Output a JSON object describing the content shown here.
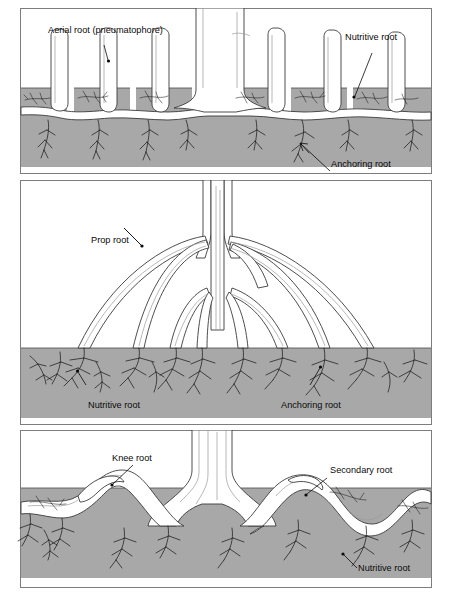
{
  "figure": {
    "background_color": "#ffffff",
    "soil_color": "#a8a8a8",
    "outline_color": "#3a3a3a",
    "label_color": "#0a0a0a"
  },
  "panels": [
    {
      "id": "aerial",
      "name": "Aerial root panel",
      "labels": [
        {
          "text": "Aerial root (pneumatophore)",
          "x": 48,
          "y": 33,
          "anchor": "start"
        },
        {
          "text": "Nutritive root",
          "x": 345,
          "y": 40,
          "anchor": "start"
        },
        {
          "text": "Anchoring root",
          "x": 331,
          "y": 167,
          "anchor": "start"
        }
      ]
    },
    {
      "id": "prop",
      "name": "Prop root panel",
      "labels": [
        {
          "text": "Prop root",
          "x": 91,
          "y": 243,
          "anchor": "start"
        },
        {
          "text": "Nutritive root",
          "x": 88,
          "y": 408,
          "anchor": "start"
        },
        {
          "text": "Anchoring root",
          "x": 281,
          "y": 408,
          "anchor": "start"
        }
      ]
    },
    {
      "id": "knee",
      "name": "Knee root panel",
      "labels": [
        {
          "text": "Knee root",
          "x": 112,
          "y": 461,
          "anchor": "start"
        },
        {
          "text": "Secondary root",
          "x": 330,
          "y": 473,
          "anchor": "start"
        },
        {
          "text": "Nutritive root",
          "x": 358,
          "y": 571,
          "anchor": "start"
        }
      ]
    }
  ]
}
